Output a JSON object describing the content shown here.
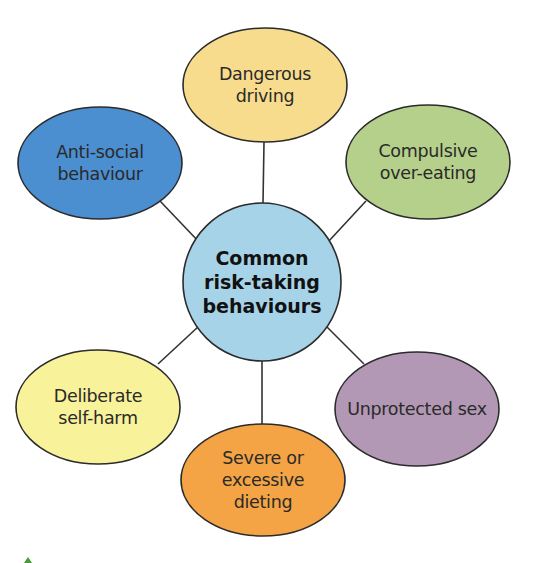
{
  "diagram": {
    "type": "mind-map",
    "center": {
      "lines": [
        "Common",
        "risk-taking",
        "behaviours"
      ],
      "fill": "#a7d3e8",
      "cx": 262,
      "cy": 282,
      "r": 79
    },
    "nodes": [
      {
        "id": "dangerous-driving",
        "lines": [
          "Dangerous",
          "driving"
        ],
        "fill": "#f8dc8e",
        "cx": 265,
        "cy": 85,
        "rx": 82,
        "ry": 57
      },
      {
        "id": "anti-social-behaviour",
        "lines": [
          "Anti-social",
          "behaviour"
        ],
        "fill": "#4b8fd0",
        "cx": 100,
        "cy": 163,
        "rx": 82,
        "ry": 56
      },
      {
        "id": "compulsive-over-eating",
        "lines": [
          "Compulsive",
          "over-eating"
        ],
        "fill": "#b5d08a",
        "cx": 428,
        "cy": 162,
        "rx": 82,
        "ry": 57
      },
      {
        "id": "deliberate-self-harm",
        "lines": [
          "Deliberate",
          "self-harm"
        ],
        "fill": "#f8f29a",
        "cx": 98,
        "cy": 407,
        "rx": 82,
        "ry": 57
      },
      {
        "id": "unprotected-sex",
        "lines": [
          "Unprotected sex"
        ],
        "fill": "#b298b4",
        "cx": 417,
        "cy": 409,
        "rx": 82,
        "ry": 57
      },
      {
        "id": "severe-dieting",
        "lines": [
          "Severe or",
          "excessive",
          "dieting"
        ],
        "fill": "#f4a445",
        "cx": 263,
        "cy": 480,
        "rx": 82,
        "ry": 56
      }
    ],
    "connectors": [
      {
        "to": "dangerous-driving",
        "x1": 264,
        "y1": 142,
        "x2": 263,
        "y2": 203
      },
      {
        "to": "anti-social-behaviour",
        "x1": 160,
        "y1": 201,
        "x2": 200,
        "y2": 243
      },
      {
        "to": "compulsive-over-eating",
        "x1": 366,
        "y1": 201,
        "x2": 328,
        "y2": 242
      },
      {
        "to": "deliberate-self-harm",
        "x1": 158,
        "y1": 364,
        "x2": 199,
        "y2": 326
      },
      {
        "to": "unprotected-sex",
        "x1": 364,
        "y1": 364,
        "x2": 326,
        "y2": 326
      },
      {
        "to": "severe-dieting",
        "x1": 262,
        "y1": 361,
        "x2": 262,
        "y2": 424
      }
    ],
    "outline_color": "#2b2b2b",
    "line_color": "#333333"
  },
  "caption": {
    "marker_color": "#4a9a3a",
    "text_visible": false
  }
}
